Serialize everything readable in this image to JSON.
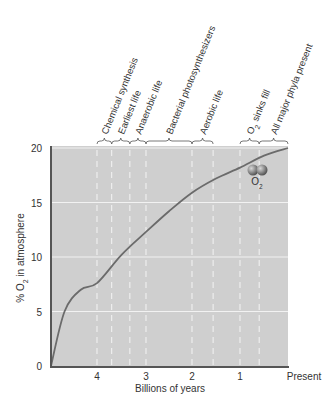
{
  "chart_data": {
    "type": "line",
    "title": "",
    "xlabel": "Billions of years",
    "ylabel": "% O2 in atmosphere",
    "ylabel_parts": {
      "pre": "% O",
      "sub": "2",
      "post": " in atmosphere"
    },
    "x_ticks": [
      {
        "label": "4",
        "value": 4
      },
      {
        "label": "3",
        "value": 3
      },
      {
        "label": "2",
        "value": 2
      },
      {
        "label": "1",
        "value": 1
      },
      {
        "label": "Present",
        "value": 0
      }
    ],
    "y_ticks": [
      0,
      5,
      10,
      15,
      20
    ],
    "xlim": [
      4.85,
      0
    ],
    "ylim": [
      0,
      20
    ],
    "grid": {
      "horizontal": true,
      "vertical_dashed": true
    },
    "series": [
      {
        "name": "O2 in atmosphere",
        "color": "#6b6b6b",
        "x": [
          4.85,
          4.6,
          4.3,
          4.0,
          3.5,
          3.0,
          2.5,
          2.0,
          1.5,
          1.0,
          0.5,
          0.0
        ],
        "y": [
          0,
          5.0,
          7.0,
          7.6,
          10.2,
          12.3,
          14.2,
          15.9,
          17.2,
          18.2,
          19.3,
          20.0
        ]
      }
    ],
    "eras": [
      {
        "label": "Chemical synthesis",
        "start": 4.0,
        "end": 3.7
      },
      {
        "label": "Earliest life",
        "start": 3.7,
        "end": 3.33
      },
      {
        "label": "Anaerobic life",
        "start": 3.33,
        "end": 3.0
      },
      {
        "label": "Bacterial photosynthesizers",
        "start": 3.0,
        "end": 2.0
      },
      {
        "label": "Aerobic life",
        "start": 2.0,
        "end": 1.56
      },
      {
        "label": "O2 sinks fill",
        "label_parts": {
          "pre": "O",
          "sub": "2",
          "post": " sinks fill"
        },
        "start": 1.0,
        "end": 0.6
      },
      {
        "label": "All major phyla present",
        "start": 0.6,
        "end": 0.0
      }
    ],
    "annotation": {
      "label": "O2",
      "pre": "O",
      "sub": "2",
      "x": 0.6,
      "y": 17.5
    }
  },
  "colors": {
    "plot_bg": "#cfcfcf",
    "grid": "#f2f2f2",
    "axis": "#555555",
    "curve": "#6b6b6b",
    "text": "#333333",
    "molecule": "#8a8a8a"
  }
}
